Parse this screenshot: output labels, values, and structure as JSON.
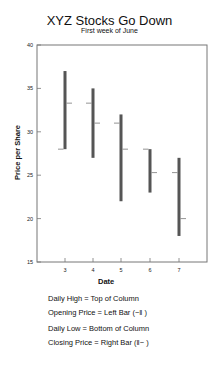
{
  "chart_data": {
    "type": "stock-ohlc",
    "title": "XYZ Stocks Go Down",
    "subtitle": "First week of June",
    "xlabel": "Date",
    "ylabel": "Price per Share",
    "ylim": [
      15,
      40
    ],
    "yticks": [
      15,
      20,
      25,
      30,
      35,
      40
    ],
    "categories": [
      "3",
      "4",
      "5",
      "6",
      "7"
    ],
    "series": [
      {
        "name": "High",
        "values": [
          37,
          35,
          32,
          28,
          27
        ]
      },
      {
        "name": "Low",
        "values": [
          28,
          27,
          22,
          23,
          18
        ]
      },
      {
        "name": "Open",
        "values": [
          28,
          33.3,
          31,
          28,
          25.3
        ]
      },
      {
        "name": "Close",
        "values": [
          33.3,
          31,
          28,
          25.3,
          20
        ]
      }
    ],
    "bar_color": "#555555",
    "grid": false
  },
  "legend": [
    "Daily High = Top of Column",
    "Opening Price = Left Bar (−‖ )",
    "Daily Low = Bottom of Column",
    "Closing Price = Right Bar (‖− )"
  ]
}
